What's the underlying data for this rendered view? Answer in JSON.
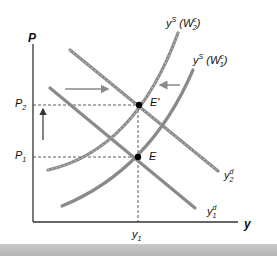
{
  "diagram": {
    "axes": {
      "y_axis_label": "P",
      "x_axis_label": "y"
    },
    "price_levels": [
      {
        "base": "P",
        "sub": "2"
      },
      {
        "base": "P",
        "sub": "1"
      }
    ],
    "output_level": {
      "base": "y",
      "sub": "1"
    },
    "points": [
      {
        "label": "E'"
      },
      {
        "label": "E"
      }
    ],
    "curves": {
      "supply_new": {
        "base": "y",
        "sup": "S",
        "arg_open": " (W",
        "arg_sup": "c",
        "arg_sub": "2",
        "arg_close": ")"
      },
      "supply_old": {
        "base": "y",
        "sup": "S",
        "arg_open": " (W",
        "arg_sup": "c",
        "arg_sub": "1",
        "arg_close": ")"
      },
      "demand_new": {
        "base": "y",
        "sup": "d",
        "sub": "2"
      },
      "demand_old": {
        "base": "y",
        "sup": "d",
        "sub": "1"
      }
    },
    "colors": {
      "curve": "#8a8a8a",
      "curve_dark": "#6f6f6f",
      "axis": "#222222",
      "point": "#000000",
      "band": "#bdbdbd"
    }
  }
}
